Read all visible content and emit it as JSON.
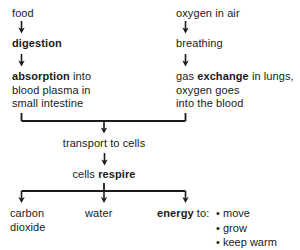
{
  "diagram": {
    "stroke_color": "#1a1a1a",
    "background": "#ffffff",
    "left_branch": {
      "start": "food",
      "step1": "digestion",
      "step2_bold": "absorption",
      "step2_rest": " into\nblood plasma in\nsmall intestine"
    },
    "right_branch": {
      "start": "oxygen in air",
      "step1": "breathing",
      "step2_pre": "gas ",
      "step2_bold": "exchange",
      "step2_rest": " in lungs,\noxygen goes\ninto the blood"
    },
    "merge": {
      "transport": "transport to cells",
      "respire_pre": "cells ",
      "respire_bold": "respire"
    },
    "outputs": {
      "carbon_dioxide": "carbon\ndioxide",
      "water": "water",
      "energy_bold": "energy",
      "energy_rest": " to:",
      "energy_uses": [
        "move",
        "grow",
        "keep warm"
      ],
      "bullet_glyph": "•"
    },
    "icons": {
      "arrow_down": "arrow-down-icon",
      "bracket_merge": "bracket-merge-icon",
      "bracket_split": "bracket-split-icon"
    }
  }
}
